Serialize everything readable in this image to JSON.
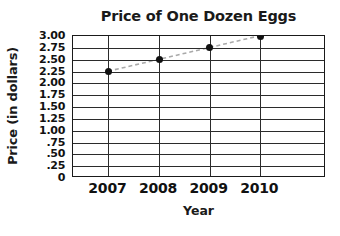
{
  "chart_data": {
    "type": "line",
    "title": "Price of One Dozen Eggs",
    "xlabel": "Year",
    "ylabel": "Price (in dollars)",
    "categories": [
      "2007",
      "2008",
      "2009",
      "2010"
    ],
    "values": [
      2.25,
      2.5,
      2.75,
      3.0
    ],
    "series": [
      {
        "name": "Price of One Dozen Eggs",
        "values": [
          2.25,
          2.5,
          2.75,
          3.0
        ]
      }
    ],
    "ylim": [
      0,
      3.0
    ],
    "ytick_values": [
      3.0,
      2.75,
      2.5,
      2.25,
      2.0,
      1.75,
      1.5,
      1.25,
      1.0,
      0.75,
      0.5,
      0.25,
      0
    ],
    "ytick_labels": [
      "3.00",
      "2.75",
      "2.50",
      "2.25",
      "2.00",
      "1.75",
      "1.50",
      "1.25",
      "1.00",
      ".75",
      ".50",
      ".25",
      "0"
    ],
    "xtick_labels": [
      "2007",
      "2008",
      "2009",
      "2010"
    ],
    "grid": "both",
    "legend": "none",
    "marker": "filled-circle",
    "line_style": "dashed",
    "colors": {
      "axis": "#1a1a1a",
      "grid": "#2b2b2b",
      "marker": "#111111",
      "line": "#a9a9a9",
      "background": "#ffffff"
    }
  }
}
